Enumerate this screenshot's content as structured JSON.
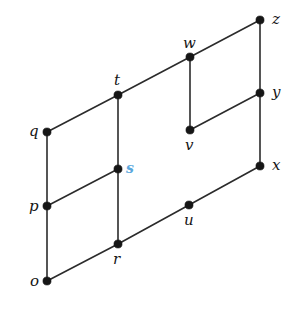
{
  "figure": {
    "kind": "hasse-diagram",
    "background_color": "#ffffff",
    "edge_color": "#2b2b2b",
    "node_color": "#161616",
    "label_color": "#151515",
    "accent_color": "#5aa7dd",
    "width": 302,
    "height": 313
  },
  "chart_data": {
    "type": "diagram",
    "title": "",
    "xlabel": "",
    "ylabel": "",
    "nodes": [
      {
        "id": "o",
        "label": "o",
        "x": 47,
        "y": 281,
        "label_x": 30,
        "label_y": 274,
        "accent": false
      },
      {
        "id": "p",
        "label": "p",
        "x": 47,
        "y": 206,
        "label_x": 29,
        "label_y": 199,
        "accent": false
      },
      {
        "id": "q",
        "label": "q",
        "x": 47,
        "y": 132,
        "label_x": 29,
        "label_y": 124,
        "accent": false
      },
      {
        "id": "r",
        "label": "r",
        "x": 118,
        "y": 244,
        "label_x": 113,
        "label_y": 252,
        "accent": false
      },
      {
        "id": "s",
        "label": "s",
        "x": 118,
        "y": 169,
        "label_x": 126,
        "label_y": 161,
        "accent": true
      },
      {
        "id": "t",
        "label": "t",
        "x": 118,
        "y": 95,
        "label_x": 114,
        "label_y": 73,
        "accent": false
      },
      {
        "id": "u",
        "label": "u",
        "x": 189,
        "y": 205,
        "label_x": 184,
        "label_y": 213,
        "accent": false
      },
      {
        "id": "v",
        "label": "v",
        "x": 190,
        "y": 130,
        "label_x": 185,
        "label_y": 138,
        "accent": false
      },
      {
        "id": "w",
        "label": "w",
        "x": 190,
        "y": 57,
        "label_x": 183,
        "label_y": 36,
        "accent": false
      },
      {
        "id": "x",
        "label": "x",
        "x": 260,
        "y": 166,
        "label_x": 272,
        "label_y": 158,
        "accent": false
      },
      {
        "id": "y",
        "label": "y",
        "x": 260,
        "y": 93,
        "label_x": 272,
        "label_y": 85,
        "accent": false
      },
      {
        "id": "z",
        "label": "z",
        "x": 260,
        "y": 20,
        "label_x": 272,
        "label_y": 12,
        "accent": false
      }
    ],
    "edges": [
      {
        "from": "o",
        "to": "q",
        "name": "edge-o-q"
      },
      {
        "from": "r",
        "to": "t",
        "name": "edge-r-t"
      },
      {
        "from": "x",
        "to": "z",
        "name": "edge-x-z"
      },
      {
        "from": "v",
        "to": "w",
        "name": "edge-v-w"
      },
      {
        "from": "o",
        "to": "r",
        "name": "edge-o-r"
      },
      {
        "from": "p",
        "to": "s",
        "name": "edge-p-s"
      },
      {
        "from": "q",
        "to": "t",
        "name": "edge-q-t"
      },
      {
        "from": "r",
        "to": "u",
        "name": "edge-r-u"
      },
      {
        "from": "u",
        "to": "x",
        "name": "edge-u-x"
      },
      {
        "from": "t",
        "to": "w",
        "name": "edge-t-w"
      },
      {
        "from": "w",
        "to": "z",
        "name": "edge-w-z"
      },
      {
        "from": "v",
        "to": "y",
        "name": "edge-v-y"
      }
    ]
  }
}
